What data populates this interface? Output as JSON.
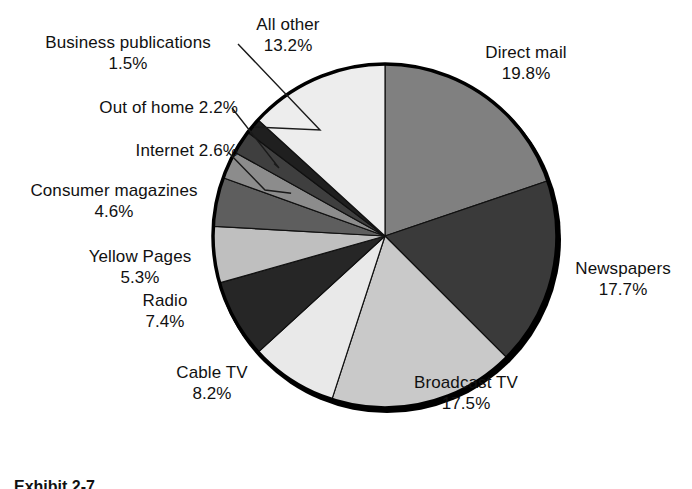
{
  "caption": "Exhibit 2-7",
  "colors": {
    "background": "#ffffff",
    "text": "#111111",
    "leader_line": "#1a1a1a",
    "pie_outline": "#000000"
  },
  "chart_data": {
    "type": "pie",
    "title": "",
    "subtitle": "",
    "xlabel": "",
    "ylabel": "",
    "grid": false,
    "legend_position": "callout-labels",
    "units": "percent",
    "start_angle_deg": 0,
    "direction": "clockwise",
    "total": 101.9999,
    "categories": [
      "Direct mail",
      "Newspapers",
      "Broadcast TV",
      "Cable TV",
      "Radio",
      "Yellow Pages",
      "Consumer magazines",
      "Internet",
      "Out of home",
      "Business publications",
      "All other"
    ],
    "values": [
      19.8,
      17.7,
      17.5,
      8.2,
      7.4,
      5.3,
      4.6,
      2.6,
      2.2,
      1.5,
      13.2
    ],
    "slices": [
      {
        "id": "direct-mail",
        "label": "Direct mail",
        "percent_text": "19.8%",
        "value": 19.8,
        "color": "#808080",
        "label_align": "center",
        "label_inline": false
      },
      {
        "id": "newspapers",
        "label": "Newspapers",
        "percent_text": "17.7%",
        "value": 17.7,
        "color": "#3a3a3a",
        "label_align": "center",
        "label_inline": false
      },
      {
        "id": "broadcast-tv",
        "label": "Broadcast TV",
        "percent_text": "17.5%",
        "value": 17.5,
        "color": "#c9c9c9",
        "label_align": "center",
        "label_inline": false
      },
      {
        "id": "cable-tv",
        "label": "Cable TV",
        "percent_text": "8.2%",
        "value": 8.2,
        "color": "#e9e9e9",
        "label_align": "center",
        "label_inline": false
      },
      {
        "id": "radio",
        "label": "Radio",
        "percent_text": "7.4%",
        "value": 7.4,
        "color": "#262626",
        "label_align": "center",
        "label_inline": false
      },
      {
        "id": "yellow-pages",
        "label": "Yellow Pages",
        "percent_text": "5.3%",
        "value": 5.3,
        "color": "#bfbfbf",
        "label_align": "center",
        "label_inline": false
      },
      {
        "id": "consumer-magazines",
        "label": "Consumer magazines",
        "percent_text": "4.6%",
        "value": 4.6,
        "color": "#5e5e5e",
        "label_align": "center",
        "label_inline": false
      },
      {
        "id": "internet",
        "label": "Internet",
        "percent_text": "2.6%",
        "value": 2.6,
        "color": "#8c8c8c",
        "label_align": "right",
        "label_inline": true
      },
      {
        "id": "out-of-home",
        "label": "Out of home",
        "percent_text": "2.2%",
        "value": 2.2,
        "color": "#3f3f3f",
        "label_align": "right",
        "label_inline": true
      },
      {
        "id": "business-publications",
        "label": "Business publications",
        "percent_text": "1.5%",
        "value": 1.5,
        "color": "#1f1f1f",
        "label_align": "center",
        "label_inline": false
      },
      {
        "id": "all-other",
        "label": "All other",
        "percent_text": "13.2%",
        "value": 13.2,
        "color": "#ededed",
        "label_align": "center",
        "label_inline": false
      }
    ]
  }
}
